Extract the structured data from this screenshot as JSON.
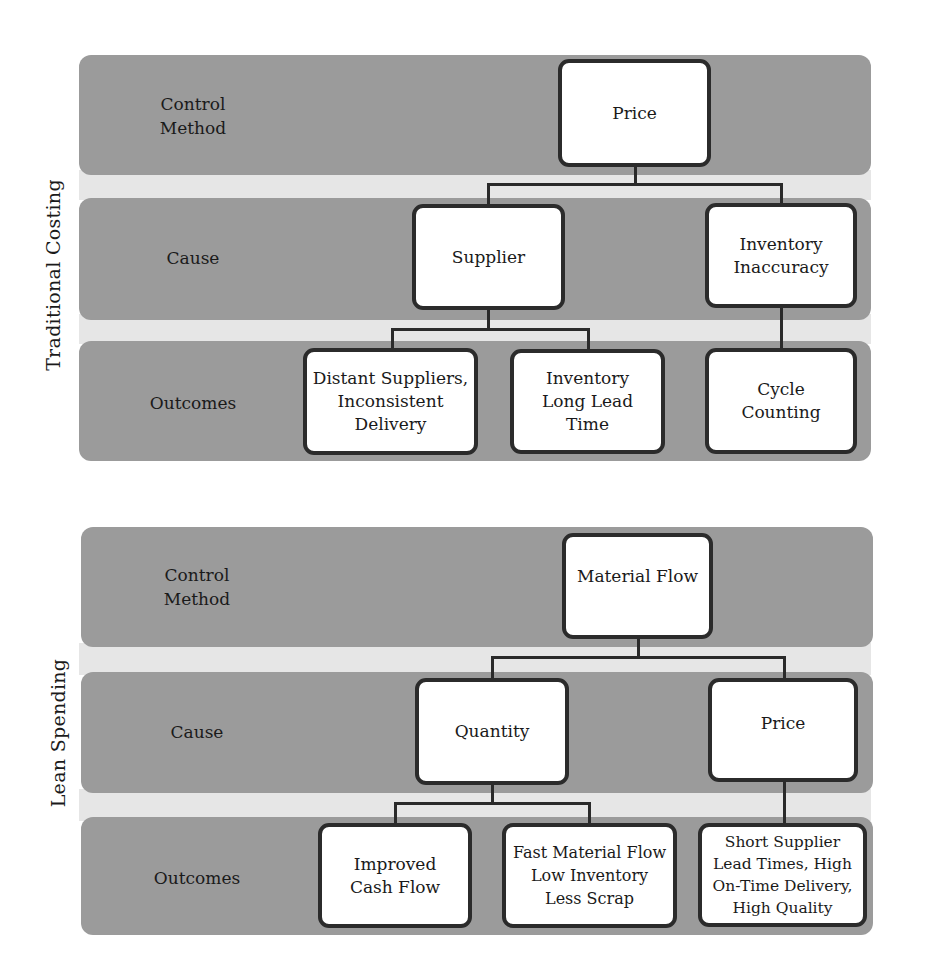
{
  "diagrams": [
    {
      "side_label": "Traditional Costing",
      "rows": {
        "control_method": "Control\nMethod",
        "cause": "Cause",
        "outcomes": "Outcomes"
      },
      "control_method": {
        "label": "Price"
      },
      "causes": [
        {
          "label": "Supplier"
        },
        {
          "label": "Inventory\nInaccuracy"
        }
      ],
      "outcomes": [
        {
          "label": "Distant Suppliers,\nInconsistent\nDelivery",
          "parent": "Supplier"
        },
        {
          "label": "Inventory\nLong Lead\nTime",
          "parent": "Supplier"
        },
        {
          "label": "Cycle\nCounting",
          "parent": "Inventory Inaccuracy"
        }
      ]
    },
    {
      "side_label": "Lean Spending",
      "rows": {
        "control_method": "Control\nMethod",
        "cause": "Cause",
        "outcomes": "Outcomes"
      },
      "control_method": {
        "label": "Material Flow"
      },
      "causes": [
        {
          "label": "Quantity"
        },
        {
          "label": "Price"
        }
      ],
      "outcomes": [
        {
          "label": "Improved\nCash Flow",
          "parent": "Quantity"
        },
        {
          "label": "Fast Material Flow\nLow Inventory\nLess Scrap",
          "parent": "Quantity"
        },
        {
          "label": "Short Supplier\nLead Times, High\nOn-Time Delivery,\nHigh Quality",
          "parent": "Price"
        }
      ]
    }
  ],
  "colors": {
    "band": "#9b9b9b",
    "gap": "#e6e6e6",
    "node_fill": "#ffffff",
    "node_border": "#2b2b2b",
    "connector": "#2a2a2a"
  }
}
